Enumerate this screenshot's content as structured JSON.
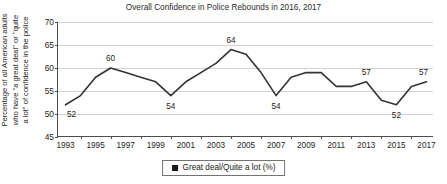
{
  "chart_data": {
    "type": "line",
    "title": "Overall Confidence in Police Rebounds in 2016, 2017",
    "xlabel": "",
    "ylabel_lines": [
      "Percentage of all American adults",
      "who have \"a great deal\" or \"quite",
      "a lot\" of confidence in the police"
    ],
    "x": [
      1993,
      1994,
      1995,
      1996,
      1997,
      1998,
      1999,
      2000,
      2001,
      2002,
      2003,
      2004,
      2005,
      2006,
      2007,
      2008,
      2009,
      2010,
      2011,
      2012,
      2013,
      2014,
      2015,
      2016,
      2017
    ],
    "values": [
      52,
      54,
      58,
      60,
      59,
      58,
      57,
      54,
      57,
      59,
      61,
      64,
      63,
      59,
      54,
      58,
      59,
      59,
      56,
      56,
      57,
      53,
      52,
      56,
      57
    ],
    "series": [
      {
        "name": "Great deal/Quite a lot (%)",
        "color": "#333333",
        "values": [
          52,
          54,
          58,
          60,
          59,
          58,
          57,
          54,
          57,
          59,
          61,
          64,
          63,
          59,
          54,
          58,
          59,
          59,
          56,
          56,
          57,
          53,
          52,
          56,
          57
        ]
      }
    ],
    "ylim": [
      45,
      70
    ],
    "yticks": [
      45,
      50,
      55,
      60,
      65,
      70
    ],
    "ytick_labels": [
      "45",
      "50",
      "55",
      "60",
      "65",
      "70"
    ],
    "xlim": [
      1992.5,
      2017.5
    ],
    "xticks": [
      1994,
      1996,
      1998,
      2000,
      2002,
      2004,
      2006,
      2008,
      2010,
      2012,
      2014,
      2016
    ],
    "xtick_labels": [
      "1993",
      "1995",
      "1997",
      "1999",
      "2001",
      "2003",
      "2005",
      "2007",
      "2009",
      "2011",
      "2013",
      "2015",
      "2017"
    ],
    "xtick_label_values": [
      1993,
      1995,
      1997,
      1999,
      2001,
      2003,
      2005,
      2007,
      2009,
      2011,
      2013,
      2015,
      2017
    ],
    "grid": "horizontal",
    "legend_position": "bottom",
    "point_labels": [
      {
        "x": 1993,
        "y": 52,
        "text": "52",
        "dx": 6,
        "dy": 9
      },
      {
        "x": 1996,
        "y": 60,
        "text": "60",
        "dx": 0,
        "dy": -10
      },
      {
        "x": 2000,
        "y": 54,
        "text": "54",
        "dx": 0,
        "dy": 10
      },
      {
        "x": 2004,
        "y": 64,
        "text": "64",
        "dx": 0,
        "dy": -10
      },
      {
        "x": 2007,
        "y": 54,
        "text": "54",
        "dx": 0,
        "dy": 10
      },
      {
        "x": 2013,
        "y": 57,
        "text": "57",
        "dx": 0,
        "dy": -10
      },
      {
        "x": 2015,
        "y": 52,
        "text": "52",
        "dx": 0,
        "dy": 10
      },
      {
        "x": 2017,
        "y": 57,
        "text": "57",
        "dx": -3,
        "dy": -10
      }
    ]
  },
  "legend": {
    "items": [
      {
        "label": "Great deal/Quite a lot (%)",
        "color": "#1a1a1a",
        "marker": "square"
      }
    ]
  },
  "colors": {
    "line": "#333333",
    "grid": "#d2d2d2",
    "axis": "#4d4d4d",
    "text": "#1a1a1a",
    "background": "#ffffff"
  }
}
